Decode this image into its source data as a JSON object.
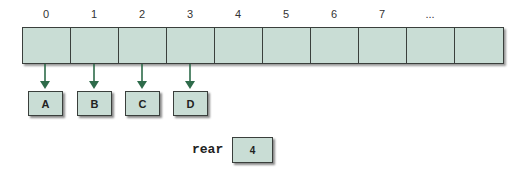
{
  "diagram": {
    "type": "array-queue",
    "indices": [
      "0",
      "1",
      "2",
      "3",
      "4",
      "5",
      "6",
      "7",
      "...",
      ""
    ],
    "cell_count": 10,
    "elements": [
      {
        "index": 0,
        "value": "A"
      },
      {
        "index": 1,
        "value": "B"
      },
      {
        "index": 2,
        "value": "C"
      },
      {
        "index": 3,
        "value": "D"
      }
    ],
    "rear": {
      "label": "rear",
      "value": "4"
    },
    "colors": {
      "cell_fill": "#c9ddd5",
      "border": "#3a3f3c",
      "arrow": "#2e6b4a"
    }
  }
}
